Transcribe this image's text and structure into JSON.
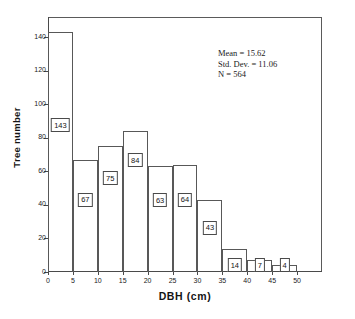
{
  "chart_data": {
    "type": "bar",
    "title": "",
    "xlabel": "DBH (cm)",
    "ylabel": "Tree number",
    "categories": [
      "0-5",
      "5-10",
      "10-15",
      "15-20",
      "20-25",
      "25-30",
      "30-35",
      "35-40",
      "40-45",
      "45-50"
    ],
    "bin_edges": [
      0,
      5,
      10,
      15,
      20,
      25,
      30,
      35,
      40,
      45,
      50
    ],
    "values": [
      143,
      67,
      75,
      84,
      63,
      64,
      43,
      14,
      7,
      4
    ],
    "bar_labels": [
      "143",
      "67",
      "75",
      "84",
      "63",
      "64",
      "43",
      "14",
      "7",
      "4"
    ],
    "xlim": [
      0,
      55
    ],
    "ylim": [
      0,
      152
    ],
    "xticks": [
      0,
      5,
      10,
      15,
      20,
      25,
      30,
      35,
      40,
      45,
      50
    ],
    "xtick_labels": [
      "0",
      "5",
      "10",
      "15",
      "20",
      "25",
      "30",
      "35",
      "40",
      "45",
      "50"
    ],
    "yticks": [
      0,
      20,
      40,
      60,
      80,
      100,
      120,
      140
    ],
    "ytick_labels": [
      "0",
      "20",
      "40",
      "60",
      "80",
      "100",
      "120",
      "140"
    ],
    "grid": false,
    "legend": false,
    "bar_fill": "none",
    "bar_edge_color": "#585858",
    "annotations": [
      "Mean = 15.62",
      "Std. Dev. = 11.06",
      "N = 564"
    ]
  },
  "stats": {
    "mean_line": "Mean = 15.62",
    "std_dev_line": "Std. Dev. = 11.06",
    "n_line": "N = 564"
  }
}
